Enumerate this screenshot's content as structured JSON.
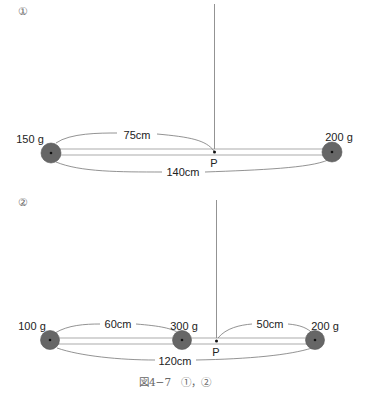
{
  "figure_1": {
    "marker": "①",
    "left_mass": "150 g",
    "right_mass": "200 g",
    "distance_to_pivot": "75cm",
    "total_length": "140cm",
    "pivot_label": "P"
  },
  "figure_2": {
    "marker": "②",
    "left_mass": "100 g",
    "middle_mass": "300 g",
    "right_mass": "200 g",
    "left_to_middle": "60cm",
    "pivot_to_right": "50cm",
    "total_length": "120cm",
    "pivot_label": "P"
  },
  "caption": "図4−7　①，②",
  "colors": {
    "ball_fill": "#666666",
    "ball_stroke": "#555555",
    "line": "#777777"
  }
}
